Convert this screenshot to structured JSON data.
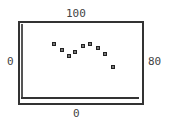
{
  "chart_data": {
    "type": "scatter",
    "title": "",
    "xlabel": "",
    "ylabel": "",
    "axis_labels": {
      "top": "100",
      "left": "0",
      "right": "80",
      "bottom": "0"
    },
    "xlim": [
      0,
      80
    ],
    "ylim": [
      0,
      100
    ],
    "grid": false,
    "legend": null,
    "marker": "square",
    "x": [
      22,
      27,
      32,
      36,
      41,
      46,
      51,
      56,
      61
    ],
    "y": [
      71,
      63,
      56,
      61,
      69,
      71,
      66,
      58,
      42
    ]
  },
  "style": {
    "frame_color": "#333333",
    "marker_color": "#222222",
    "label_color": "#444444"
  }
}
